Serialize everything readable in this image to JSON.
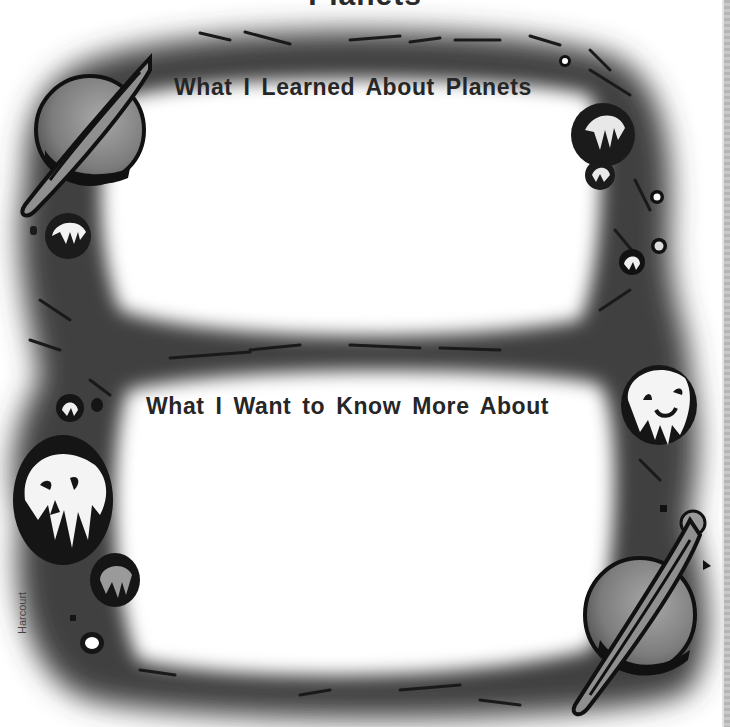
{
  "worksheet": {
    "title_clipped": "Planets",
    "sections": [
      {
        "id": "learned",
        "heading": "What I Learned About Planets",
        "answer": ""
      },
      {
        "id": "want_to_know",
        "heading": "What I Want to Know More About",
        "answer": ""
      }
    ],
    "publisher_credit": "Harcourt"
  },
  "colors": {
    "frame": "#5a5a5a",
    "frame_dark": "#2c2c2c",
    "planet_fill": "#8a8a8a",
    "outline": "#111111",
    "text": "#262626",
    "background": "#ffffff"
  },
  "illustrations": [
    "ringed-planet-top-left",
    "cratered-moon-left",
    "cratered-moon-right-top",
    "small-moons-right",
    "smiling-moon-right",
    "skull-face-moon-left",
    "cratered-moon-lower-left",
    "ringed-planet-bottom-right"
  ]
}
